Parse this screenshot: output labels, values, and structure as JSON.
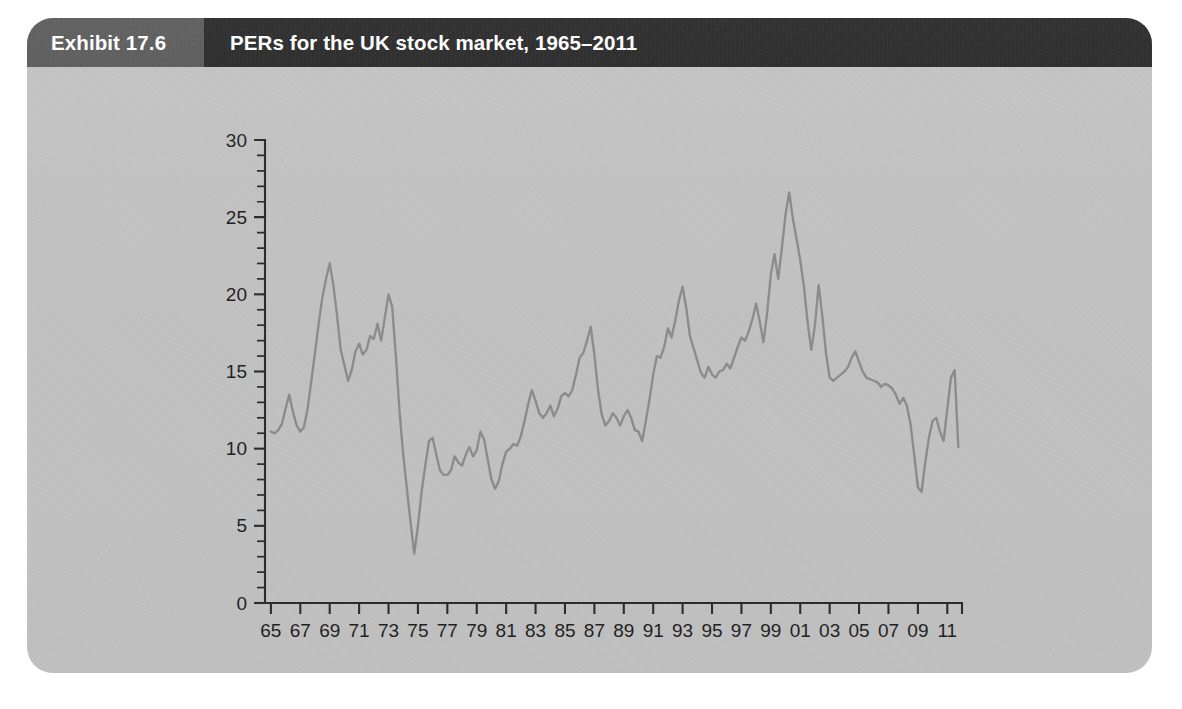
{
  "exhibit": {
    "number_label": "Exhibit 17.6",
    "title": "PERs for the UK stock market, 1965–2011"
  },
  "colors": {
    "card_background": "#c2c2c2",
    "header_number_band": "#595959",
    "header_title_band": "#262626",
    "header_text": "#ffffff",
    "axis": "#2b2b2b",
    "series_line": "#8c8c8c",
    "page_background": "#ffffff"
  },
  "chart_data": {
    "type": "line",
    "title": "PERs for the UK stock market, 1965–2011",
    "xlabel": "",
    "ylabel": "",
    "xlim": [
      1964.6,
      2012.0
    ],
    "ylim": [
      0,
      30
    ],
    "grid": false,
    "legend": null,
    "y_ticks": [
      0,
      5,
      10,
      15,
      20,
      25,
      30
    ],
    "y_tick_labels": [
      "0",
      "5",
      "10",
      "15",
      "20",
      "25",
      "30"
    ],
    "y_minor_tick_step": 1,
    "x_ticks": [
      1965,
      1967,
      1969,
      1971,
      1973,
      1975,
      1977,
      1979,
      1981,
      1983,
      1985,
      1987,
      1989,
      1991,
      1993,
      1995,
      1997,
      1999,
      2001,
      2003,
      2005,
      2007,
      2009,
      2011
    ],
    "x_tick_labels": [
      "65",
      "67",
      "69",
      "71",
      "73",
      "75",
      "77",
      "79",
      "81",
      "83",
      "85",
      "87",
      "89",
      "91",
      "93",
      "95",
      "97",
      "99",
      "01",
      "03",
      "05",
      "07",
      "09",
      "11"
    ],
    "series": [
      {
        "name": "UK stock market PER",
        "x": [
          1965.0,
          1965.25,
          1965.5,
          1965.75,
          1966.0,
          1966.25,
          1966.5,
          1966.75,
          1967.0,
          1967.25,
          1967.5,
          1967.75,
          1968.0,
          1968.25,
          1968.5,
          1968.75,
          1969.0,
          1969.25,
          1969.5,
          1969.75,
          1970.0,
          1970.25,
          1970.5,
          1970.75,
          1971.0,
          1971.25,
          1971.5,
          1971.75,
          1972.0,
          1972.25,
          1972.5,
          1972.75,
          1973.0,
          1973.25,
          1973.5,
          1973.75,
          1974.0,
          1974.25,
          1974.5,
          1974.75,
          1975.0,
          1975.25,
          1975.5,
          1975.75,
          1976.0,
          1976.25,
          1976.5,
          1976.75,
          1977.0,
          1977.25,
          1977.5,
          1977.75,
          1978.0,
          1978.25,
          1978.5,
          1978.75,
          1979.0,
          1979.25,
          1979.5,
          1979.75,
          1980.0,
          1980.25,
          1980.5,
          1980.75,
          1981.0,
          1981.25,
          1981.5,
          1981.75,
          1982.0,
          1982.25,
          1982.5,
          1982.75,
          1983.0,
          1983.25,
          1983.5,
          1983.75,
          1984.0,
          1984.25,
          1984.5,
          1984.75,
          1985.0,
          1985.25,
          1985.5,
          1985.75,
          1986.0,
          1986.25,
          1986.5,
          1986.75,
          1987.0,
          1987.25,
          1987.5,
          1987.75,
          1988.0,
          1988.25,
          1988.5,
          1988.75,
          1989.0,
          1989.25,
          1989.5,
          1989.75,
          1990.0,
          1990.25,
          1990.5,
          1990.75,
          1991.0,
          1991.25,
          1991.5,
          1991.75,
          1992.0,
          1992.25,
          1992.5,
          1992.75,
          1993.0,
          1993.25,
          1993.5,
          1993.75,
          1994.0,
          1994.25,
          1994.5,
          1994.75,
          1995.0,
          1995.25,
          1995.5,
          1995.75,
          1996.0,
          1996.25,
          1996.5,
          1996.75,
          1997.0,
          1997.25,
          1997.5,
          1997.75,
          1998.0,
          1998.25,
          1998.5,
          1998.75,
          1999.0,
          1999.25,
          1999.5,
          1999.75,
          2000.0,
          2000.25,
          2000.5,
          2000.75,
          2001.0,
          2001.25,
          2001.5,
          2001.75,
          2002.0,
          2002.25,
          2002.5,
          2002.75,
          2003.0,
          2003.25,
          2003.5,
          2003.75,
          2004.0,
          2004.25,
          2004.5,
          2004.75,
          2005.0,
          2005.25,
          2005.5,
          2005.75,
          2006.0,
          2006.25,
          2006.5,
          2006.75,
          2007.0,
          2007.25,
          2007.5,
          2007.75,
          2008.0,
          2008.25,
          2008.5,
          2008.75,
          2009.0,
          2009.25,
          2009.5,
          2009.75,
          2010.0,
          2010.25,
          2010.5,
          2010.75,
          2011.0,
          2011.25,
          2011.5,
          2011.75
        ],
        "values": [
          11.1,
          11.0,
          11.2,
          11.6,
          12.6,
          13.5,
          12.4,
          11.5,
          11.1,
          11.4,
          12.6,
          14.4,
          16.2,
          18.1,
          19.8,
          21.0,
          22.0,
          20.6,
          18.6,
          16.4,
          15.4,
          14.4,
          15.1,
          16.3,
          16.8,
          16.1,
          16.4,
          17.3,
          17.1,
          18.1,
          17.0,
          18.5,
          20.0,
          19.2,
          16.0,
          12.4,
          9.6,
          7.4,
          5.2,
          3.2,
          5.0,
          7.2,
          8.9,
          10.5,
          10.7,
          9.6,
          8.6,
          8.3,
          8.3,
          8.6,
          9.5,
          9.1,
          8.9,
          9.6,
          10.1,
          9.5,
          9.9,
          11.1,
          10.6,
          9.3,
          8.0,
          7.4,
          7.9,
          9.0,
          9.8,
          10.0,
          10.3,
          10.2,
          10.8,
          11.8,
          12.9,
          13.8,
          13.1,
          12.3,
          12.0,
          12.3,
          12.8,
          12.1,
          12.6,
          13.4,
          13.6,
          13.4,
          13.8,
          14.8,
          15.9,
          16.2,
          17.0,
          17.9,
          16.1,
          13.8,
          12.2,
          11.5,
          11.8,
          12.3,
          12.0,
          11.5,
          12.1,
          12.5,
          12.0,
          11.2,
          11.1,
          10.5,
          11.8,
          13.2,
          14.8,
          16.0,
          15.9,
          16.6,
          17.8,
          17.2,
          18.3,
          19.6,
          20.5,
          19.1,
          17.3,
          16.5,
          15.7,
          14.9,
          14.6,
          15.3,
          14.8,
          14.6,
          15.0,
          15.1,
          15.5,
          15.2,
          15.9,
          16.6,
          17.2,
          17.0,
          17.6,
          18.4,
          19.4,
          18.2,
          16.9,
          18.8,
          21.3,
          22.6,
          21.0,
          23.0,
          25.2,
          26.6,
          24.9,
          23.6,
          22.2,
          20.5,
          18.2,
          16.4,
          18.0,
          20.6,
          18.6,
          16.2,
          14.6,
          14.4,
          14.6,
          14.8,
          15.0,
          15.3,
          15.9,
          16.3,
          15.6,
          15.0,
          14.6,
          14.5,
          14.4,
          14.3,
          14.0,
          14.2,
          14.1,
          13.9,
          13.5,
          12.9,
          13.3,
          12.8,
          11.6,
          9.6,
          7.5,
          7.2,
          9.1,
          10.7,
          11.8,
          12.0,
          11.1,
          10.5,
          12.6,
          14.6,
          15.1,
          10.1
        ]
      }
    ]
  }
}
